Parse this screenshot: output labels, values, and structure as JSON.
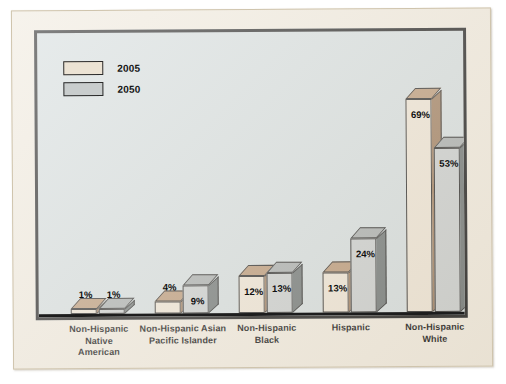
{
  "chart_data": {
    "type": "bar",
    "title": "",
    "xlabel": "",
    "ylabel": "",
    "ylim": [
      0,
      75
    ],
    "grid": false,
    "legend_position": "top-left",
    "categories": [
      "Non-Hispanic Native American",
      "Non-Hispanic Asian Pacific Islander",
      "Non-Hispanic Black",
      "Hispanic",
      "Non-Hispanic White"
    ],
    "category_lines": [
      [
        "Non-Hispanic",
        "Native",
        "American"
      ],
      [
        "Non-Hispanic Asian",
        "Pacific Islander"
      ],
      [
        "Non-Hispanic",
        "Black"
      ],
      [
        "Hispanic"
      ],
      [
        "Non-Hispanic",
        "White"
      ]
    ],
    "series": [
      {
        "name": "2005",
        "color": "#ece3d4",
        "values": [
          1,
          4,
          12,
          13,
          69
        ],
        "labels": [
          "1%",
          "4%",
          "12%",
          "13%",
          "69%"
        ]
      },
      {
        "name": "2050",
        "color": "#c9cdcd",
        "values": [
          1,
          9,
          13,
          24,
          53
        ],
        "labels": [
          "1%",
          "9%",
          "13%",
          "24%",
          "53%"
        ]
      }
    ]
  },
  "legend": {
    "items": [
      {
        "label": "2005",
        "color": "#ece3d4"
      },
      {
        "label": "2050",
        "color": "#c9cdcd"
      }
    ]
  },
  "colors": {
    "page_background": "#ffffff",
    "card_background": "#efe9dd",
    "plot_background": "#d4dcdd",
    "frame_border": "#1d1d1d",
    "series_2005_front": "#ece3d4",
    "series_2005_top": "#b99878",
    "series_2005_side": "#9e7e60",
    "series_2050_front": "#c9cdcd",
    "series_2050_top": "#a8adad",
    "series_2050_side": "#6f7676",
    "text": "#111111"
  }
}
